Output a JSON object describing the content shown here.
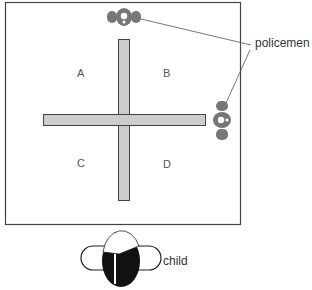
{
  "diagram": {
    "regions": [
      {
        "id": "A",
        "label": "A"
      },
      {
        "id": "B",
        "label": "B"
      },
      {
        "id": "C",
        "label": "C"
      },
      {
        "id": "D",
        "label": "D"
      }
    ],
    "callouts": {
      "policemen": "policemen",
      "child": "child"
    },
    "colors": {
      "border": "#444444",
      "cross_fill": "#cccccc",
      "policeman_fill": "#777777",
      "child_fill": "#111111"
    }
  }
}
